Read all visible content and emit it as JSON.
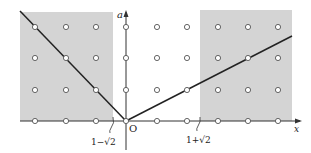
{
  "diagram": {
    "axes": {
      "x_label": "x",
      "y_label": "a",
      "origin_label": "O"
    },
    "shaded_regions": [
      {
        "name": "left-region",
        "description": "x ≤ 1−√2",
        "color": "#d4d4d4"
      },
      {
        "name": "right-region",
        "description": "x ≥ 1+√2",
        "color": "#d4d4d4"
      }
    ],
    "tick_labels": {
      "left_boundary": "1−√2",
      "right_boundary": "1+√2"
    },
    "lines": [
      {
        "name": "left-line",
        "equation": "a = −x",
        "through": [
          [
            -3,
            3
          ],
          [
            -2,
            2
          ],
          [
            -1,
            1
          ],
          [
            0,
            0
          ]
        ]
      },
      {
        "name": "right-line",
        "equation": "a = x/2",
        "through": [
          [
            0,
            0
          ],
          [
            2,
            1
          ],
          [
            4,
            2
          ]
        ]
      }
    ],
    "lattice_points": {
      "x_range": [
        -3,
        5
      ],
      "a_range": [
        0,
        3
      ]
    },
    "colors": {
      "shade": "#d4d4d4",
      "line": "#222222",
      "point_fill": "#ffffff",
      "point_stroke": "#555555"
    }
  }
}
